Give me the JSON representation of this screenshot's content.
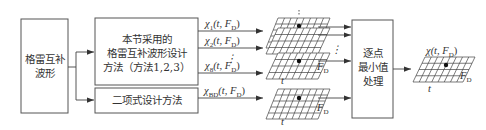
{
  "boxes": {
    "source": {
      "lines": [
        "格雷互补",
        "波形"
      ]
    },
    "method_main": {
      "lines": [
        "本节采用的",
        "格雷互补波形设计",
        "方法（方法1,2,3）"
      ]
    },
    "method_binomial": {
      "lines": [
        "二项式设计方法"
      ]
    },
    "processing": {
      "lines": [
        "逐点",
        "最小值",
        "处理"
      ]
    }
  },
  "signals": [
    {
      "symbol": "χ",
      "sub": "1",
      "args": "(t, F",
      "argsub": "D",
      "close": ")"
    },
    {
      "symbol": "χ",
      "sub": "2",
      "args": "(t, F",
      "argsub": "D",
      "close": ")"
    },
    {
      "symbol": "χ",
      "sub": "8",
      "args": "(t, F",
      "argsub": "D",
      "close": ")"
    },
    {
      "symbol": "χ",
      "sub": "BD",
      "args": "(t, F",
      "argsub": "D",
      "close": ")"
    }
  ],
  "dots_vertical": "⋮",
  "axis_labels": {
    "t": "t",
    "fd": "F",
    "fd_sub": "D"
  },
  "output": {
    "symbol": "χ",
    "args": "(t, F",
    "argsub": "D",
    "close": ")"
  }
}
